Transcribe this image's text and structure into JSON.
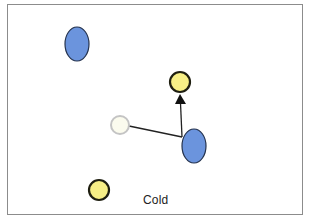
{
  "diagram": {
    "label": "Cold",
    "colors": {
      "blue_particle": "#6b94dd",
      "yellow_particle": "#f7ef86",
      "ghost_particle": "#fbfbee",
      "ghost_stroke": "#c4c4c4",
      "border": "#8c8c8c"
    },
    "particles": [
      {
        "type": "blue",
        "cx": 77,
        "cy": 44,
        "rx": 12,
        "ry": 17
      },
      {
        "type": "blue",
        "cx": 194,
        "cy": 146,
        "rx": 12,
        "ry": 17
      },
      {
        "type": "yellow",
        "cx": 180,
        "cy": 82,
        "r": 10
      },
      {
        "type": "yellow",
        "cx": 99,
        "cy": 190,
        "r": 10
      },
      {
        "type": "ghost",
        "cx": 120,
        "cy": 125,
        "r": 9
      }
    ],
    "arrows": [
      {
        "from": [
          129,
          126
        ],
        "to": [
          182,
          137
        ],
        "head": false
      },
      {
        "from": [
          182,
          137
        ],
        "to": [
          180,
          96
        ],
        "head": true
      }
    ]
  }
}
